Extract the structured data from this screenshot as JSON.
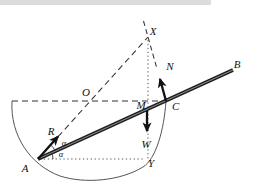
{
  "figure": {
    "points": {
      "A": "A",
      "B": "B",
      "C": "C",
      "M": "M",
      "O": "O",
      "X": "X",
      "Y": "Y"
    },
    "forces": {
      "R": "R",
      "N": "N",
      "W": "W"
    },
    "angles": {
      "upper": "α",
      "lower": "α"
    },
    "colors": {
      "line": "#2f2f2f",
      "rod": "#1f1f1f",
      "arc": "#555555",
      "label": "#111111",
      "top_band": "#dcdcdc",
      "background": "#ffffff"
    }
  }
}
